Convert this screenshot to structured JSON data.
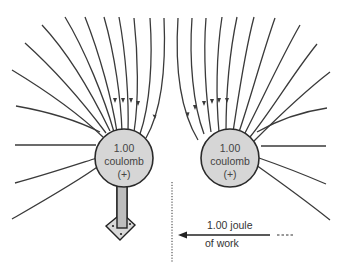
{
  "diagram": {
    "charges": [
      {
        "id": "fixed-charge",
        "value_line": "1.00",
        "unit_line": "coulomb",
        "sign_line": "(+)",
        "has_stand": true
      },
      {
        "id": "moving-charge",
        "value_line": "1.00",
        "unit_line": "coulomb",
        "sign_line": "(+)",
        "has_stand": false
      }
    ],
    "work_label": {
      "line1": "1.00 joule",
      "line2": "of work"
    },
    "colors": {
      "charge_fill": "#d6d6d6",
      "line": "#3a3a3a",
      "stand_fill": "#bdbdbd"
    }
  }
}
